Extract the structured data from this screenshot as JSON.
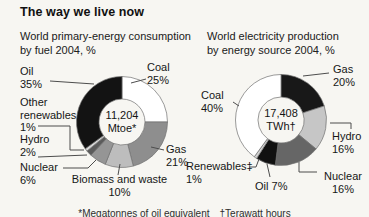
{
  "header": {
    "title": "The way we live now"
  },
  "footnote": "*Megatonnes of oil equivalent  †Terawatt hours",
  "chart_data": [
    {
      "type": "pie",
      "subtype": "donut",
      "title": "World primary-energy consumption by fuel 2004, %",
      "title_lines": [
        "World primary-energy consumption",
        "by fuel 2004, %"
      ],
      "center_value": "11,204",
      "center_unit": "Mtoe*",
      "start_angle_deg": 0,
      "direction": "clockwise",
      "legend_position": "around",
      "segments": [
        {
          "label": "Coal",
          "pct": "25%",
          "value": 25,
          "color": "#ffffff"
        },
        {
          "label": "Gas",
          "pct": "21%",
          "value": 21,
          "color": "#8e8e8e"
        },
        {
          "label": "Biomass and waste",
          "pct": "10%",
          "value": 10,
          "color": "#bdbdbd"
        },
        {
          "label": "Nuclear",
          "pct": "6%",
          "value": 6,
          "color": "#959595"
        },
        {
          "label": "Hydro",
          "pct": "2%",
          "value": 2,
          "color": "#5b5b5b"
        },
        {
          "label": "Other renewables",
          "pct": "1%",
          "value": 1,
          "color": "#d8d8d8"
        },
        {
          "label": "Oil",
          "pct": "35%",
          "value": 35,
          "color": "#131313"
        }
      ]
    },
    {
      "type": "pie",
      "subtype": "donut",
      "title": "World electricity production by energy source 2004, %",
      "title_lines": [
        "World electricity production",
        "by energy source 2004, %"
      ],
      "center_value": "17,408",
      "center_unit": "TWh†",
      "start_angle_deg": 0,
      "direction": "clockwise",
      "legend_position": "around",
      "segments": [
        {
          "label": "Gas",
          "pct": "20%",
          "value": 20,
          "color": "#181818"
        },
        {
          "label": "Hydro",
          "pct": "16%",
          "value": 16,
          "color": "#c6c6c6"
        },
        {
          "label": "Nuclear",
          "pct": "16%",
          "value": 16,
          "color": "#666666"
        },
        {
          "label": "Oil",
          "pct": "7%",
          "value": 7,
          "color": "#111111"
        },
        {
          "label": "Renewables‡",
          "pct": "1%",
          "value": 1,
          "color": "#d2d2d2"
        },
        {
          "label": "Coal",
          "pct": "40%",
          "value": 40,
          "color": "#ffffff"
        }
      ]
    }
  ]
}
